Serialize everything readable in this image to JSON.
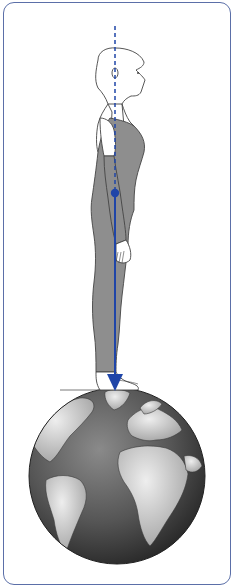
{
  "diagram": {
    "ground": "earth globe",
    "line_of_gravity": {
      "color": "#1f45a8",
      "dashed_segment": "head to center of mass",
      "solid_segment": "center of mass to ground",
      "center_of_mass_marker": "dot",
      "end_marker": "arrowhead"
    },
    "colors": {
      "border": "#5b6fa8",
      "clothing": "#8e8e8e",
      "outline": "#444444",
      "skin": "#ffffff",
      "globe_ocean": "#4a4a4a",
      "globe_land": "#cfcfcf"
    }
  }
}
